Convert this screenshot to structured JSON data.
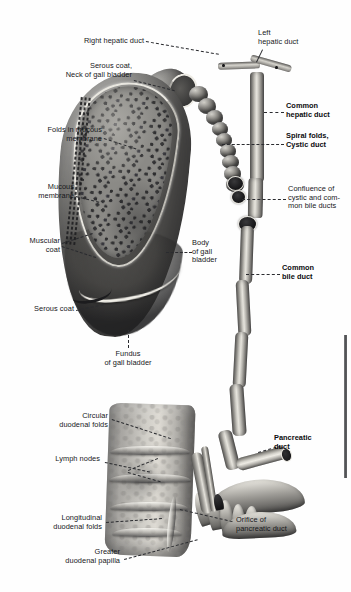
{
  "plate": {
    "kind": "anatomical-illustration",
    "subject": "Gall bladder, biliary ducts and duodenum, sectioned",
    "background_color": "#fefefe",
    "ink_color": "#16171a",
    "edge_artifact_color": "#3f4043"
  },
  "labels": [
    {
      "id": "right-hepatic-duct",
      "text": "Right hepatic duct",
      "bold": false,
      "align": "right"
    },
    {
      "id": "left-hepatic-duct",
      "text": "Left\nhepatic duct",
      "bold": false,
      "align": "left"
    },
    {
      "id": "serous-coat-neck",
      "text": "Serous coat,\nNeck of gall bladder",
      "bold": false,
      "align": "right"
    },
    {
      "id": "common-hepatic-duct",
      "text": "Common\nhepatic duct",
      "bold": true,
      "align": "left"
    },
    {
      "id": "folds-in-mucous-membrane",
      "text": "Folds in mucous\nmembrane",
      "bold": false,
      "align": "right"
    },
    {
      "id": "spiral-folds-cystic-duct",
      "text": "Spiral folds,\nCystic duct",
      "bold": true,
      "align": "left"
    },
    {
      "id": "mucous-membrane",
      "text": "Mucous\nmembrane",
      "bold": false,
      "align": "right"
    },
    {
      "id": "confluence",
      "text": "Confluence of\ncystic and com-\nmon bile ducts",
      "bold": false,
      "align": "left"
    },
    {
      "id": "muscular-coat",
      "text": "Muscular\ncoat",
      "bold": false,
      "align": "right"
    },
    {
      "id": "body-of-gall-bladder",
      "text": "Body\nof gall\nbladder",
      "bold": false,
      "align": "left"
    },
    {
      "id": "common-bile-duct",
      "text": "Common\nbile duct",
      "bold": true,
      "align": "left"
    },
    {
      "id": "serous-coat",
      "text": "Serous coat",
      "bold": false,
      "align": "right"
    },
    {
      "id": "fundus-of-gall-bladder",
      "text": "Fundus\nof gall bladder",
      "bold": false,
      "align": "center"
    },
    {
      "id": "circular-duodenal-folds",
      "text": "Circular\nduodenal folds",
      "bold": false,
      "align": "right"
    },
    {
      "id": "pancreatic-duct",
      "text": "Pancreatic\nduct",
      "bold": true,
      "align": "left"
    },
    {
      "id": "lymph-nodes",
      "text": "Lymph nodes",
      "bold": false,
      "align": "right"
    },
    {
      "id": "longitudinal-duodenal-folds",
      "text": "Longitudinal\nduodenal folds",
      "bold": false,
      "align": "right"
    },
    {
      "id": "orifice-of-pancreatic-duct",
      "text": "Orifice of\npancreatic duct",
      "bold": false,
      "align": "left"
    },
    {
      "id": "greater-duodenal-papilla",
      "text": "Greater\nduodenal papilla",
      "bold": false,
      "align": "right"
    }
  ]
}
